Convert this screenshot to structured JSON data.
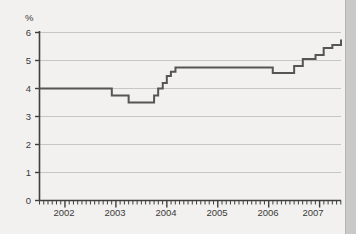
{
  "chart_data": {
    "type": "line",
    "title": "",
    "subtitle": "",
    "xlabel": "",
    "ylabel": "%",
    "ylim": [
      0,
      6
    ],
    "xlim": [
      2001.5,
      2007.42
    ],
    "grid": true,
    "legend": false,
    "line_style": "step",
    "line_color": "#555555",
    "y_ticks": [
      0,
      1,
      2,
      3,
      4,
      5,
      6
    ],
    "y_tick_labels": [
      "0",
      "1",
      "2",
      "3",
      "4",
      "5",
      "6"
    ],
    "x_ticks": [
      2002,
      2003,
      2004,
      2005,
      2006,
      2007
    ],
    "x_tick_labels": [
      "2002",
      "2003",
      "2004",
      "2005",
      "2006",
      "2007"
    ],
    "minor_x_ticks": "monthly",
    "series": [
      {
        "name": "Interest rate",
        "x": [
          2001.5,
          2002.58,
          2002.92,
          2003.25,
          2003.58,
          2003.75,
          2003.83,
          2003.92,
          2004.0,
          2004.08,
          2004.17,
          2005.08,
          2006.08,
          2006.33,
          2006.5,
          2006.67,
          2006.92,
          2007.08,
          2007.25,
          2007.42
        ],
        "values": [
          4.0,
          4.0,
          3.75,
          3.5,
          3.5,
          3.75,
          4.0,
          4.2,
          4.45,
          4.6,
          4.75,
          4.75,
          4.55,
          4.55,
          4.8,
          5.05,
          5.2,
          5.45,
          5.55,
          5.75
        ]
      }
    ],
    "annotations": []
  },
  "axes": {
    "y_axis_unit": "%",
    "axis_color": "#444444",
    "grid_color": "#c4c4c2",
    "background": "#f2f1ef"
  }
}
